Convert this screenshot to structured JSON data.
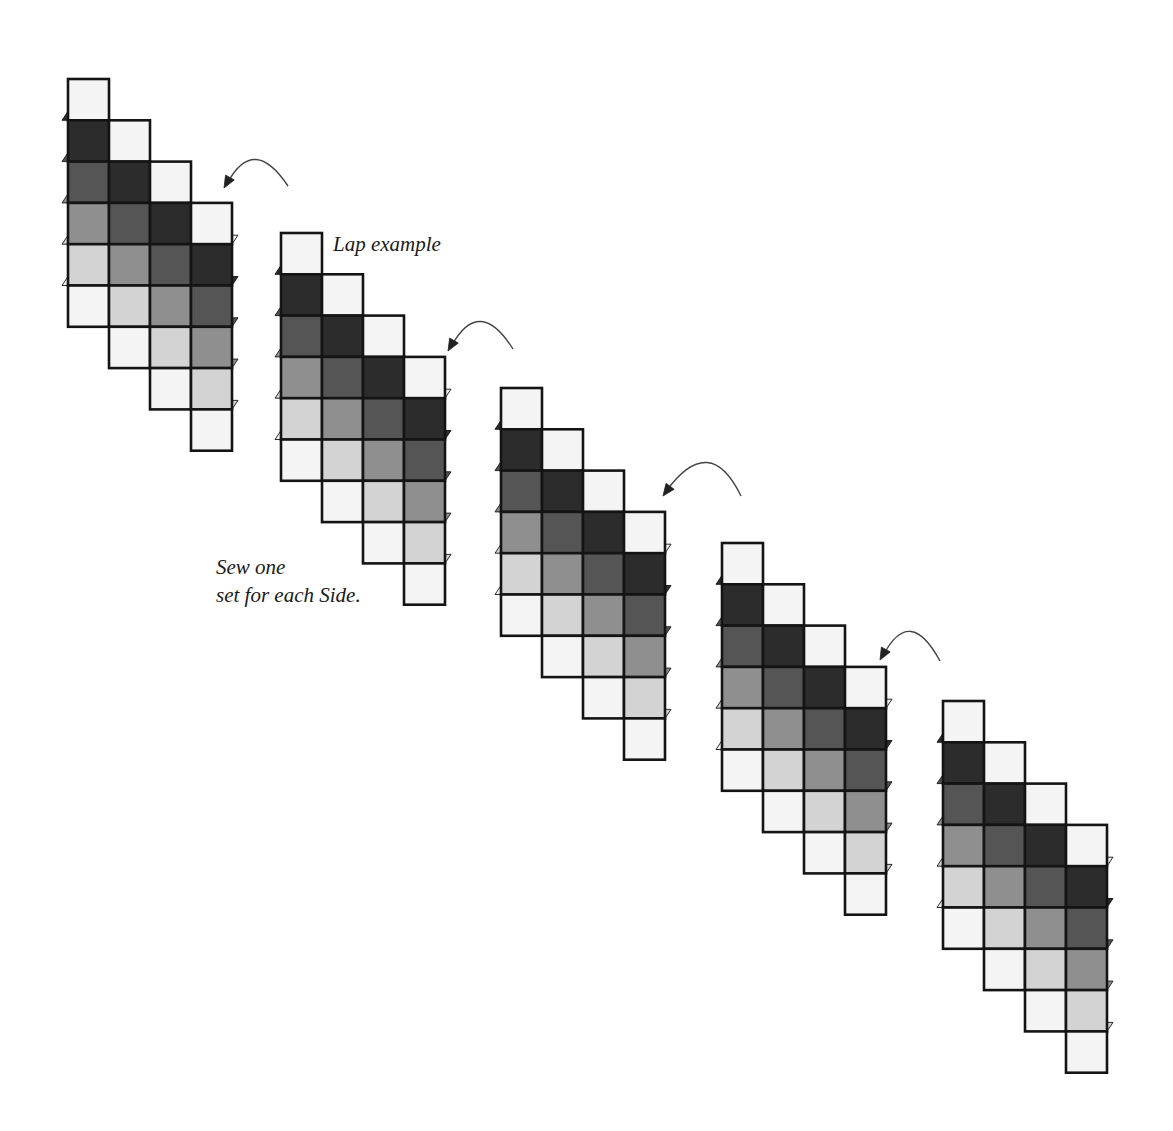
{
  "diagram": {
    "labels": {
      "lap_example": "Lap example",
      "sew_instruction_line1": "Sew one",
      "sew_instruction_line2": "set for each Side."
    },
    "colors": {
      "white": "#f4f4f4",
      "darkest": "#2c2c2c",
      "dark": "#555555",
      "medium": "#8f8f8f",
      "light": "#d3d3d3",
      "outline": "#141414",
      "arrow": "#444444"
    },
    "unit_pattern": {
      "columns": 4,
      "squares_per_column": 6,
      "column_shades": [
        "white",
        "darkest",
        "dark",
        "medium",
        "light",
        "white"
      ],
      "column_step_down_squares": 1
    },
    "square_size": {
      "width": 41,
      "height": 41.3
    },
    "blocks": [
      {
        "id": 1,
        "x": 68,
        "y": 79
      },
      {
        "id": 2,
        "x": 281,
        "y": 233
      },
      {
        "id": 3,
        "x": 501,
        "y": 388
      },
      {
        "id": 4,
        "x": 722,
        "y": 543
      },
      {
        "id": 5,
        "x": 943,
        "y": 701
      }
    ],
    "arrows": [
      {
        "from": [
          288,
          186
        ],
        "peak": [
          255,
          161
        ],
        "to": [
          224,
          188
        ]
      },
      {
        "from": [
          513,
          349
        ],
        "peak": [
          480,
          323
        ],
        "to": [
          448,
          351
        ]
      },
      {
        "from": [
          741,
          496
        ],
        "peak": [
          706,
          464
        ],
        "to": [
          663,
          496
        ]
      },
      {
        "from": [
          940,
          661
        ],
        "peak": [
          910,
          633
        ],
        "to": [
          880,
          660
        ]
      }
    ]
  }
}
